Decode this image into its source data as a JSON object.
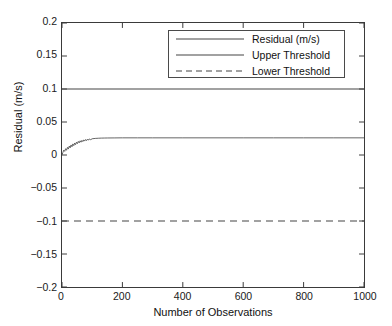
{
  "chart_data": {
    "type": "line",
    "title": "",
    "xlabel": "Number of Observations",
    "ylabel": "Residual (m/s)",
    "xlim": [
      0,
      1000
    ],
    "ylim": [
      -0.2,
      0.2
    ],
    "grid": false,
    "legend_position": "top-right-inside",
    "xticks": [
      0,
      200,
      400,
      600,
      800,
      1000
    ],
    "xticklabels": [
      "0",
      "200",
      "400",
      "600",
      "800",
      "1000"
    ],
    "yticks": [
      0.2,
      0.15,
      0.1,
      0.05,
      0,
      -0.05,
      -0.1,
      -0.15,
      -0.2
    ],
    "yticklabels": [
      "0.2",
      "0.15",
      "0.1",
      "0.05",
      "0",
      "-0.05",
      "-0.1",
      "-0.15",
      "-0.2"
    ],
    "series": [
      {
        "name": "Residual (m/s)",
        "style": "solid",
        "color": "#555555",
        "width": 0.9,
        "x": [
          0,
          3,
          6,
          9,
          12,
          15,
          18,
          21,
          24,
          27,
          30,
          33,
          36,
          39,
          42,
          45,
          48,
          51,
          54,
          57,
          60,
          63,
          66,
          69,
          72,
          75,
          78,
          81,
          84,
          87,
          90,
          95,
          100,
          110,
          120,
          130,
          140,
          150,
          175,
          200,
          250,
          300,
          400,
          500,
          600,
          700,
          800,
          900,
          1000
        ],
        "values": [
          0.0,
          0.004,
          0.0075,
          0.0055,
          0.0095,
          0.0072,
          0.0115,
          0.009,
          0.0135,
          0.0108,
          0.0152,
          0.0125,
          0.0168,
          0.0142,
          0.0182,
          0.0157,
          0.0195,
          0.0172,
          0.0206,
          0.0184,
          0.0215,
          0.0194,
          0.0222,
          0.0203,
          0.0229,
          0.0211,
          0.0234,
          0.0218,
          0.0239,
          0.0224,
          0.0243,
          0.0232,
          0.0246,
          0.0251,
          0.0254,
          0.0256,
          0.0257,
          0.0258,
          0.0259,
          0.026,
          0.026,
          0.026,
          0.026,
          0.026,
          0.026,
          0.026,
          0.026,
          0.026,
          0.026
        ]
      },
      {
        "name": "Upper Threshold",
        "style": "solid",
        "color": "#444444",
        "width": 1.1,
        "x": [
          0,
          1000
        ],
        "values": [
          0.1,
          0.1
        ]
      },
      {
        "name": "Lower Threshold",
        "style": "dashed",
        "color": "#444444",
        "width": 1.1,
        "x": [
          0,
          1000
        ],
        "values": [
          -0.1,
          -0.1
        ]
      }
    ]
  },
  "legend": {
    "items": [
      {
        "label": "Residual (m/s)",
        "style": "solid"
      },
      {
        "label": "Upper Threshold",
        "style": "solid"
      },
      {
        "label": "Lower Threshold",
        "style": "dashed"
      }
    ]
  },
  "colors": {
    "axis": "#3a3a3a",
    "data": "#555555",
    "threshold": "#444444",
    "background": "#ffffff",
    "text": "#111111"
  }
}
